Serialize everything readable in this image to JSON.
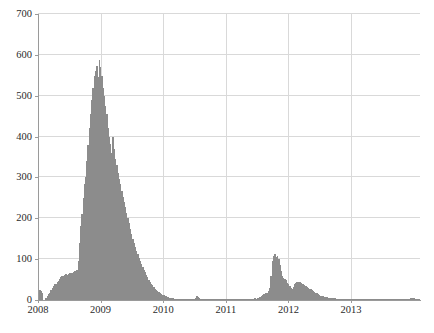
{
  "chart_data": {
    "type": "bar",
    "title": "",
    "subtitle": "",
    "xlabel": "",
    "ylabel": "",
    "xlim": [
      "2008",
      "2013.9"
    ],
    "ylim": [
      0,
      700
    ],
    "grid": true,
    "legend": null,
    "bar_color": "#8c8c8c",
    "axis_color": "#9a9a9a",
    "grid_color": "#d9d9d9",
    "tick_label_color": "#2b2b2b",
    "y_ticks": [
      0,
      100,
      200,
      300,
      400,
      500,
      600,
      700
    ],
    "y_tick_labels": [
      "0",
      "100",
      "200",
      "300",
      "400",
      "500",
      "600",
      "700"
    ],
    "x_ticks": [
      2008,
      2009,
      2010,
      2011,
      2012,
      2013
    ],
    "x_tick_labels": [
      "2008",
      "2009",
      "2010",
      "2011",
      "2012",
      "2013"
    ],
    "x_start": 2008.0,
    "x_end": 2014.1,
    "bar_step": 0.0192,
    "values": [
      22,
      24,
      21,
      18,
      0,
      0,
      6,
      10,
      14,
      18,
      24,
      30,
      34,
      38,
      40,
      44,
      46,
      52,
      56,
      58,
      60,
      62,
      64,
      62,
      64,
      66,
      65,
      66,
      68,
      70,
      72,
      74,
      96,
      140,
      180,
      210,
      250,
      285,
      300,
      340,
      380,
      420,
      455,
      490,
      520,
      548,
      560,
      572,
      545,
      588,
      570,
      548,
      520,
      500,
      475,
      455,
      420,
      400,
      382,
      360,
      400,
      370,
      345,
      330,
      310,
      295,
      285,
      268,
      252,
      240,
      228,
      212,
      200,
      188,
      174,
      162,
      150,
      140,
      130,
      120,
      112,
      104,
      96,
      88,
      80,
      74,
      68,
      62,
      56,
      50,
      45,
      40,
      36,
      32,
      28,
      25,
      22,
      19,
      17,
      15,
      13,
      12,
      10,
      9,
      8,
      7,
      6,
      5,
      4,
      4,
      3,
      3,
      2,
      2,
      2,
      1,
      1,
      1,
      1,
      1,
      1,
      1,
      1,
      1,
      1,
      1,
      2,
      6,
      9,
      8,
      5,
      3,
      2,
      1,
      1,
      1,
      1,
      1,
      1,
      1,
      1,
      1,
      1,
      1,
      1,
      1,
      1,
      1,
      1,
      1,
      1,
      1,
      1,
      1,
      1,
      1,
      1,
      1,
      1,
      1,
      1,
      1,
      1,
      1,
      1,
      1,
      1,
      1,
      1,
      1,
      1,
      1,
      1,
      2,
      3,
      4,
      3,
      4,
      6,
      8,
      10,
      12,
      14,
      12,
      16,
      18,
      22,
      30,
      60,
      95,
      108,
      112,
      105,
      108,
      100,
      86,
      72,
      60,
      55,
      52,
      48,
      42,
      38,
      34,
      30,
      28,
      32,
      38,
      42,
      44,
      45,
      44,
      42,
      40,
      38,
      36,
      34,
      32,
      30,
      28,
      26,
      24,
      22,
      20,
      18,
      16,
      14,
      12,
      11,
      10,
      9,
      8,
      7,
      7,
      6,
      6,
      5,
      5,
      4,
      4,
      4,
      3,
      3,
      3,
      3,
      3,
      3,
      3,
      3,
      3,
      3,
      3,
      3,
      3,
      3,
      3,
      3,
      3,
      3,
      3,
      3,
      3,
      3,
      3,
      3,
      3,
      3,
      3,
      3,
      3,
      3,
      3,
      3,
      3,
      3,
      3,
      3,
      3,
      3,
      3,
      3,
      3,
      3,
      3,
      3,
      3,
      3,
      3,
      3,
      3,
      3,
      3,
      3,
      3,
      3,
      3,
      3,
      3,
      3,
      3,
      3,
      4,
      5,
      5,
      4,
      3,
      3,
      3,
      3
    ]
  }
}
